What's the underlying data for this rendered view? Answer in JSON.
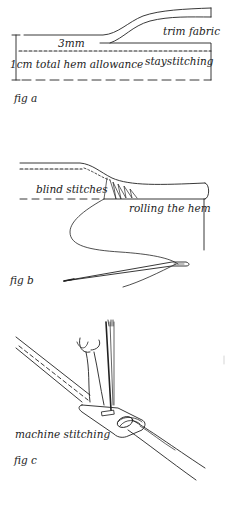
{
  "figures": {
    "fig_a": {
      "caption": "fig a",
      "labels": {
        "three_mm": "3mm",
        "trim_fabric": "trim fabric",
        "total_hem": "1cm total hem allowance",
        "staystitching": "staystitching"
      }
    },
    "fig_b": {
      "caption": "fig b",
      "labels": {
        "blind_stitches": "blind stitches",
        "rolling_the_hem": "rolling the hem"
      }
    },
    "fig_c": {
      "caption": "fig c",
      "labels": {
        "machine_stitching": "machine stitching"
      }
    }
  },
  "colors": {
    "ink": "#222222",
    "background": "#ffffff"
  }
}
